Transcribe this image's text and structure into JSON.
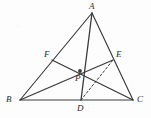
{
  "figure": {
    "type": "euclidean-geometry-diagram",
    "width": 151,
    "height": 118,
    "background_color": "#fdfdfd",
    "stroke_color": "#3a3a3a",
    "label_color": "#2b2b2b",
    "dash_pattern": "2.2 2.2"
  },
  "points": [
    {
      "id": "A",
      "label": "A",
      "x": 92,
      "y": 13,
      "label_x": 89,
      "label_y": 2,
      "marked": false
    },
    {
      "id": "B",
      "label": "B",
      "x": 20,
      "y": 100,
      "label_x": 6,
      "label_y": 95,
      "marked": false
    },
    {
      "id": "C",
      "label": "C",
      "x": 133,
      "y": 100,
      "label_x": 137,
      "label_y": 95,
      "marked": false
    },
    {
      "id": "D",
      "label": "D",
      "x": 81,
      "y": 100,
      "label_x": 77,
      "label_y": 104,
      "marked": false
    },
    {
      "id": "E",
      "label": "E",
      "x": 113,
      "y": 60,
      "label_x": 116,
      "label_y": 50,
      "marked": false
    },
    {
      "id": "F",
      "label": "F",
      "x": 52,
      "y": 60,
      "label_x": 44,
      "label_y": 50,
      "marked": false
    },
    {
      "id": "P",
      "label": "P",
      "x": 80,
      "y": 71,
      "label_x": 75,
      "label_y": 74,
      "marked": true
    }
  ],
  "segments": [
    {
      "id": "AB",
      "name": "side-ab",
      "from": "A",
      "to": "B",
      "style": "solid",
      "width": 1.15
    },
    {
      "id": "AC",
      "name": "side-ac",
      "from": "A",
      "to": "C",
      "style": "solid",
      "width": 1.15
    },
    {
      "id": "BC",
      "name": "side-bc",
      "from": "B",
      "to": "C",
      "style": "solid",
      "width": 1.15
    },
    {
      "id": "AD",
      "name": "cevian-ad",
      "from": "A",
      "to": "D",
      "style": "solid",
      "width": 1.3
    },
    {
      "id": "BE",
      "name": "cevian-be",
      "from": "B",
      "to": "E",
      "style": "solid",
      "width": 1.3
    },
    {
      "id": "CF",
      "name": "cevian-cf",
      "from": "C",
      "to": "F",
      "style": "solid",
      "width": 1.3
    },
    {
      "id": "DE",
      "name": "segment-de",
      "from": "D",
      "to": "E",
      "style": "dashed",
      "width": 1.0
    }
  ]
}
